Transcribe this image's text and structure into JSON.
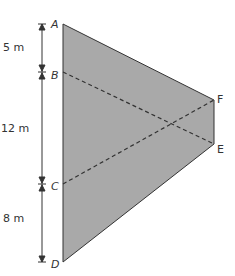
{
  "diagram": {
    "fill_color": "#a9a9a9",
    "stroke_color": "#333333",
    "vertices": {
      "A": {
        "label": "A",
        "x": 63,
        "y": 24
      },
      "B": {
        "label": "B",
        "x": 63,
        "y": 72
      },
      "C": {
        "label": "C",
        "x": 63,
        "y": 184
      },
      "D": {
        "label": "D",
        "x": 63,
        "y": 262
      },
      "E": {
        "label": "E",
        "x": 214,
        "y": 144
      },
      "F": {
        "label": "F",
        "x": 214,
        "y": 100
      }
    },
    "dimensions": [
      {
        "label": "5 m",
        "from": "A",
        "to": "B"
      },
      {
        "label": "12 m",
        "from": "B",
        "to": "C"
      },
      {
        "label": "8 m",
        "from": "C",
        "to": "D"
      }
    ],
    "dashed_lines": [
      {
        "from": "B",
        "to": "E"
      },
      {
        "from": "C",
        "to": "F"
      }
    ]
  }
}
